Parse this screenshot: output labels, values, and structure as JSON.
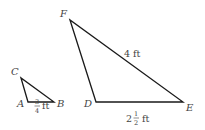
{
  "diagram": {
    "small_triangle": {
      "vertices": {
        "A": "A",
        "B": "B",
        "C": "C"
      },
      "side_AB": {
        "whole": "",
        "numerator": "3",
        "denominator": "4",
        "unit": "ft"
      }
    },
    "large_triangle": {
      "vertices": {
        "D": "D",
        "E": "E",
        "F": "F"
      },
      "side_FE": "4 ft",
      "side_DE": {
        "whole": "2",
        "numerator": "1",
        "denominator": "2",
        "unit": "ft"
      }
    },
    "stroke_color": "#1a1a1a",
    "label_color": "#444444"
  }
}
